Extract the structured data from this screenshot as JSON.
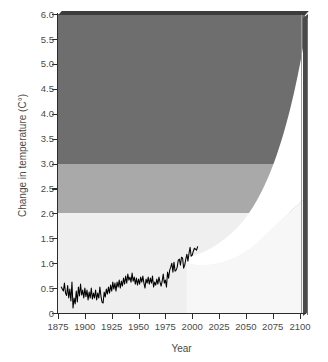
{
  "chart_data": {
    "type": "area",
    "title": "",
    "xlabel": "Year",
    "ylabel": "Change in temperature (C°)",
    "xlim": [
      1875,
      2105
    ],
    "ylim": [
      0,
      6.0
    ],
    "grid": false,
    "legend": "none",
    "xticks": [
      1875,
      1900,
      1925,
      1950,
      1975,
      2000,
      2025,
      2050,
      2075,
      2100
    ],
    "yticks": [
      "0",
      "0.5",
      "1.0",
      "1.5",
      "2.0",
      "2.5",
      "3.0",
      "3.5",
      "4.0",
      "4.5",
      "5.0",
      "5.5",
      "6.0"
    ],
    "risk_bands": [
      {
        "name": "low-risk-band",
        "from": 0.0,
        "to": 2.0,
        "color": "#efefef"
      },
      {
        "name": "moderate-risk-band",
        "from": 2.0,
        "to": 3.0,
        "color": "#a9a9a9"
      },
      {
        "name": "high-risk-band",
        "from": 3.0,
        "to": 6.0,
        "color": "#6e6e6e"
      }
    ],
    "projection_cone": {
      "name": "projection-uncertainty-cone",
      "color": "#ffffff",
      "start_year": 1995,
      "end_year": 2100,
      "upper_at_end": 5.55,
      "lower_at_end": 2.3,
      "upper": [
        [
          1995,
          1.1
        ],
        [
          2010,
          1.35
        ],
        [
          2025,
          1.75
        ],
        [
          2040,
          2.45
        ],
        [
          2055,
          3.25
        ],
        [
          2070,
          4.05
        ],
        [
          2085,
          4.85
        ],
        [
          2100,
          5.55
        ]
      ],
      "lower": [
        [
          1995,
          1.0
        ],
        [
          2015,
          1.05
        ],
        [
          2035,
          1.25
        ],
        [
          2055,
          1.55
        ],
        [
          2075,
          1.9
        ],
        [
          2090,
          2.12
        ],
        [
          2100,
          2.3
        ]
      ]
    },
    "series": [
      {
        "name": "observed-temperature",
        "label": "Observed temperature",
        "color": "#000000",
        "x_start": 1878,
        "x_end": 2005,
        "y_start": 0.45,
        "y_end": 1.33,
        "values": [
          [
            1878,
            0.52
          ],
          [
            1880,
            0.44
          ],
          [
            1881,
            0.6
          ],
          [
            1882,
            0.4
          ],
          [
            1883,
            0.35
          ],
          [
            1884,
            0.55
          ],
          [
            1885,
            0.3
          ],
          [
            1886,
            0.48
          ],
          [
            1887,
            0.24
          ],
          [
            1888,
            0.62
          ],
          [
            1889,
            0.1
          ],
          [
            1890,
            0.3
          ],
          [
            1891,
            0.18
          ],
          [
            1892,
            0.44
          ],
          [
            1893,
            0.22
          ],
          [
            1894,
            0.52
          ],
          [
            1895,
            0.34
          ],
          [
            1896,
            0.58
          ],
          [
            1897,
            0.36
          ],
          [
            1898,
            0.46
          ],
          [
            1899,
            0.3
          ],
          [
            1900,
            0.5
          ],
          [
            1901,
            0.33
          ],
          [
            1902,
            0.46
          ],
          [
            1903,
            0.26
          ],
          [
            1904,
            0.42
          ],
          [
            1905,
            0.3
          ],
          [
            1906,
            0.5
          ],
          [
            1907,
            0.28
          ],
          [
            1908,
            0.4
          ],
          [
            1909,
            0.3
          ],
          [
            1910,
            0.46
          ],
          [
            1911,
            0.26
          ],
          [
            1912,
            0.4
          ],
          [
            1913,
            0.3
          ],
          [
            1914,
            0.52
          ],
          [
            1915,
            0.34
          ],
          [
            1916,
            0.22
          ],
          [
            1917,
            0.2
          ],
          [
            1918,
            0.42
          ],
          [
            1919,
            0.32
          ],
          [
            1920,
            0.48
          ],
          [
            1921,
            0.38
          ],
          [
            1922,
            0.52
          ],
          [
            1923,
            0.4
          ],
          [
            1924,
            0.56
          ],
          [
            1925,
            0.44
          ],
          [
            1926,
            0.62
          ],
          [
            1927,
            0.48
          ],
          [
            1928,
            0.6
          ],
          [
            1929,
            0.44
          ],
          [
            1930,
            0.62
          ],
          [
            1931,
            0.52
          ],
          [
            1932,
            0.66
          ],
          [
            1933,
            0.5
          ],
          [
            1934,
            0.64
          ],
          [
            1935,
            0.54
          ],
          [
            1936,
            0.7
          ],
          [
            1937,
            0.58
          ],
          [
            1938,
            0.74
          ],
          [
            1939,
            0.6
          ],
          [
            1940,
            0.78
          ],
          [
            1941,
            0.66
          ],
          [
            1942,
            0.72
          ],
          [
            1943,
            0.62
          ],
          [
            1944,
            0.8
          ],
          [
            1945,
            0.64
          ],
          [
            1946,
            0.72
          ],
          [
            1947,
            0.58
          ],
          [
            1948,
            0.7
          ],
          [
            1949,
            0.56
          ],
          [
            1950,
            0.68
          ],
          [
            1951,
            0.58
          ],
          [
            1952,
            0.72
          ],
          [
            1953,
            0.62
          ],
          [
            1954,
            0.74
          ],
          [
            1955,
            0.6
          ],
          [
            1956,
            0.5
          ],
          [
            1957,
            0.68
          ],
          [
            1958,
            0.6
          ],
          [
            1959,
            0.72
          ],
          [
            1960,
            0.58
          ],
          [
            1961,
            0.7
          ],
          [
            1962,
            0.6
          ],
          [
            1963,
            0.74
          ],
          [
            1964,
            0.52
          ],
          [
            1965,
            0.62
          ],
          [
            1966,
            0.56
          ],
          [
            1967,
            0.68
          ],
          [
            1968,
            0.58
          ],
          [
            1969,
            0.72
          ],
          [
            1970,
            0.62
          ],
          [
            1971,
            0.54
          ],
          [
            1972,
            0.64
          ],
          [
            1973,
            0.78
          ],
          [
            1974,
            0.6
          ],
          [
            1975,
            0.66
          ],
          [
            1976,
            0.52
          ],
          [
            1977,
            0.82
          ],
          [
            1978,
            0.7
          ],
          [
            1979,
            0.86
          ],
          [
            1980,
            0.92
          ],
          [
            1981,
            1.0
          ],
          [
            1982,
            0.82
          ],
          [
            1983,
            1.02
          ],
          [
            1984,
            0.84
          ],
          [
            1985,
            0.86
          ],
          [
            1986,
            0.92
          ],
          [
            1987,
            1.06
          ],
          [
            1988,
            1.08
          ],
          [
            1989,
            0.96
          ],
          [
            1990,
            1.12
          ],
          [
            1991,
            1.1
          ],
          [
            1992,
            0.9
          ],
          [
            1993,
            0.96
          ],
          [
            1994,
            1.08
          ],
          [
            1995,
            1.18
          ],
          [
            1996,
            1.04
          ],
          [
            1997,
            1.2
          ],
          [
            1998,
            1.32
          ],
          [
            1999,
            1.14
          ],
          [
            2000,
            1.16
          ],
          [
            2001,
            1.24
          ],
          [
            2002,
            1.3
          ],
          [
            2003,
            1.28
          ],
          [
            2004,
            1.26
          ],
          [
            2005,
            1.33
          ]
        ]
      }
    ]
  }
}
